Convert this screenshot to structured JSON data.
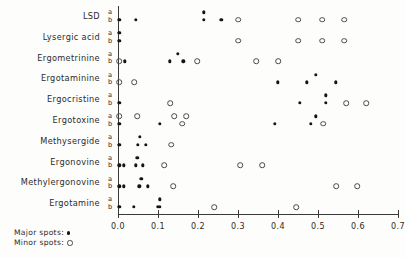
{
  "legend": {
    "major_label": "Major spots:",
    "minor_label": "Minor spots:",
    "major_symbol": "filled-circle",
    "minor_symbol": "open-circle"
  },
  "axis": {
    "sub_row_a": "a",
    "sub_row_b": "b"
  },
  "chart_data": {
    "type": "scatter",
    "title": "",
    "xlabel": "",
    "ylabel": "",
    "xlim": [
      0.0,
      0.7
    ],
    "xticks": [
      0.0,
      0.1,
      0.2,
      0.3,
      0.4,
      0.5,
      0.6,
      0.7
    ],
    "xticklabels": [
      "0.0",
      "0.1",
      "0.2",
      "0.3",
      "0.4",
      "0.5",
      "0.6",
      "0.7"
    ],
    "grid": false,
    "legend_position": "bottom-left",
    "categories": [
      "LSD",
      "Lysergic acid",
      "Ergometrinine",
      "Ergotaminine",
      "Ergocristine",
      "Ergotoxine",
      "Methysergide",
      "Ergonovine",
      "Methylergonovine",
      "Ergotamine"
    ],
    "subrows": [
      "a",
      "b"
    ],
    "series": [
      {
        "name": "LSD",
        "a": {
          "major": [
            0.215
          ],
          "minor": []
        },
        "b": {
          "major": [
            0.003,
            0.045,
            0.215,
            0.258
          ],
          "minor": [
            0.3,
            0.45,
            0.51,
            0.565
          ]
        }
      },
      {
        "name": "Lysergic acid",
        "a": {
          "major": [
            0.003
          ],
          "minor": []
        },
        "b": {
          "major": [
            0.003
          ],
          "minor": [
            0.3,
            0.45,
            0.51,
            0.565
          ]
        }
      },
      {
        "name": "Ergometrinine",
        "a": {
          "major": [
            0.15
          ],
          "minor": []
        },
        "b": {
          "major": [
            0.017,
            0.13,
            0.163
          ],
          "minor": [
            0.003,
            0.198,
            0.345,
            0.4
          ]
        }
      },
      {
        "name": "Ergotaminine",
        "a": {
          "major": [
            0.495
          ],
          "minor": []
        },
        "b": {
          "major": [
            0.4,
            0.472,
            0.545
          ],
          "minor": [
            0.003,
            0.04
          ]
        }
      },
      {
        "name": "Ergocristine",
        "a": {
          "major": [
            0.52
          ],
          "minor": []
        },
        "b": {
          "major": [
            0.003,
            0.455,
            0.52
          ],
          "minor": [
            0.13,
            0.57,
            0.62
          ]
        }
      },
      {
        "name": "Ergotoxine",
        "a": {
          "major": [
            0.495
          ],
          "minor": [
            0.003,
            0.048,
            0.14,
            0.17
          ]
        },
        "b": {
          "major": [
            0.003,
            0.105,
            0.392,
            0.482
          ],
          "minor": [
            0.16,
            0.513
          ]
        }
      },
      {
        "name": "Methysergide",
        "a": {
          "major": [
            0.055
          ],
          "minor": []
        },
        "b": {
          "major": [
            0.003,
            0.05,
            0.07
          ],
          "minor": [
            0.133
          ]
        }
      },
      {
        "name": "Ergonovine",
        "a": {
          "major": [
            0.048
          ],
          "minor": []
        },
        "b": {
          "major": [
            0.003,
            0.015,
            0.045,
            0.062
          ],
          "minor": [
            0.115,
            0.305,
            0.36
          ]
        }
      },
      {
        "name": "Methylergonovine",
        "a": {
          "major": [
            0.058
          ],
          "minor": []
        },
        "b": {
          "major": [
            0.003,
            0.015,
            0.053,
            0.075
          ],
          "minor": [
            0.138,
            0.545,
            0.598
          ]
        }
      },
      {
        "name": "Ergotamine",
        "a": {
          "major": [
            0.105
          ],
          "minor": []
        },
        "b": {
          "major": [
            0.003,
            0.04,
            0.1,
            0.105
          ],
          "minor": [
            0.24,
            0.445
          ]
        }
      }
    ]
  }
}
